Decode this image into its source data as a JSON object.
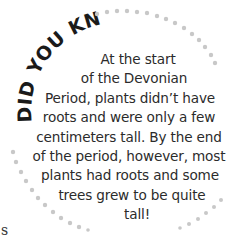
{
  "callout": {
    "heading": "DID YOU KNOW?",
    "lines": [
      "At the start",
      "of the Devonian",
      "Period, plants didn’t have",
      "roots and were only a few",
      "centimeters tall. By the end",
      "of the period, however, most",
      "plants had roots and some",
      "trees grew to be quite",
      "tall!"
    ],
    "colors": {
      "heading": "#1a1a1a",
      "text": "#2b2b2b",
      "dots": "#c8c8c8"
    }
  },
  "page_fragment": {
    "text": "s"
  }
}
